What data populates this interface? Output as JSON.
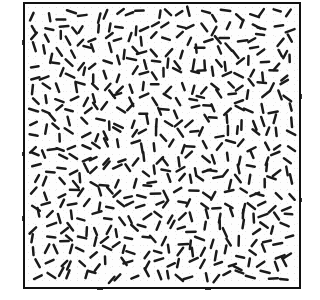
{
  "figure": {
    "kind": "random-orientation-line-texture-plate",
    "caption": "",
    "canvas": {
      "width": 320,
      "height": 300,
      "background": "#ffffff"
    },
    "frame": {
      "label": "texture plate border",
      "left": 23,
      "top": 2,
      "width": 278,
      "height": 287,
      "border_width": 2,
      "border_color": "#111111",
      "fill_color": "#fdfdfd"
    },
    "elements": {
      "label": "line segment texture elements",
      "count": 560,
      "color": "#1a1a1a",
      "length_px": 8.5,
      "length_jitter_px": 2.2,
      "thickness_px": 2.5,
      "orientation": "uniform-random",
      "orientation_min_deg": 0,
      "orientation_max_deg": 180,
      "placement": "jittered-grid",
      "grid_spacing_px": 11.8,
      "position_jitter_px": 4.6,
      "inset_px": 5,
      "random_seed": 20147
    },
    "speckle": {
      "label": "scan noise",
      "visible": true,
      "opacity": 0.5
    }
  },
  "chart_data": {
    "type": "scatter",
    "title": "",
    "xlabel": "",
    "ylabel": "",
    "grid": false,
    "legend": null,
    "xlim": [
      0,
      278
    ],
    "ylim": [
      0,
      287
    ],
    "point_count": 560,
    "marker": "line-segment",
    "marker_length": 8.5,
    "marker_width": 2.5,
    "orientation_distribution": "uniform 0-180 degrees",
    "density_per_1000px2": 7.5
  }
}
